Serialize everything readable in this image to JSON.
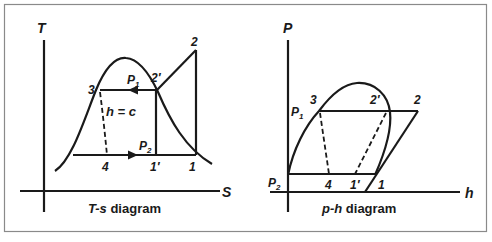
{
  "frame": {
    "border_color": "#8a8a8a"
  },
  "ts_diagram": {
    "caption_prefix": "T-s",
    "caption_suffix": " diagram",
    "y_axis_label": "T",
    "x_axis_label": "S",
    "points": {
      "p1": "1",
      "p1_prime": "1′",
      "p2": "2",
      "p2_prime": "2′",
      "p3": "3",
      "p4": "4"
    },
    "pressure_high": {
      "main": "P",
      "sub": "1"
    },
    "pressure_low": {
      "main": "P",
      "sub": "2"
    },
    "throttle_label": "h = c"
  },
  "ph_diagram": {
    "caption_prefix": "p-h",
    "caption_suffix": " diagram",
    "y_axis_label": "P",
    "x_axis_label": "h",
    "points": {
      "p1": "1",
      "p1_prime": "1′",
      "p2": "2",
      "p2_prime": "2′",
      "p3": "3",
      "p4": "4"
    },
    "pressure_high": {
      "main": "P",
      "sub": "1"
    },
    "pressure_low": {
      "main": "P",
      "sub": "2"
    }
  }
}
